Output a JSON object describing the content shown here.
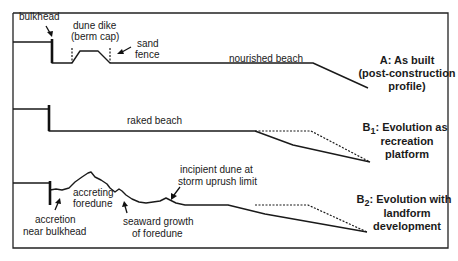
{
  "panels": {
    "a": {
      "caption_lines": [
        "A: As built",
        "(post-construction",
        "profile)"
      ],
      "labels": {
        "bulkhead": "bulkhead",
        "dune_dike_1": "dune dike",
        "dune_dike_2": "(berm cap)",
        "sand_fence_1": "sand",
        "sand_fence_2": "fence",
        "nourished_beach": "nourished beach"
      }
    },
    "b1": {
      "caption_prefix": "B",
      "caption_sub": "1",
      "caption_line1_rest": ": Evolution as",
      "caption_lines": [
        "recreation",
        "platform"
      ],
      "labels": {
        "raked_beach": "raked beach"
      }
    },
    "b2": {
      "caption_prefix": "B",
      "caption_sub": "2",
      "caption_line1_rest": ": Evolution with",
      "caption_lines": [
        "landform",
        "development"
      ],
      "labels": {
        "accretion_1": "accretion",
        "accretion_2": "near bulkhead",
        "accreting_1": "accreting",
        "accreting_2": "foredune",
        "seaward_1": "seaward growth",
        "seaward_2": "of foredune",
        "incipient_1": "incipient dune at",
        "incipient_2": "storm uprush limit"
      }
    }
  },
  "legend": {
    "solid_line": "profile",
    "dashed_line": "as-built profile (reference)"
  }
}
